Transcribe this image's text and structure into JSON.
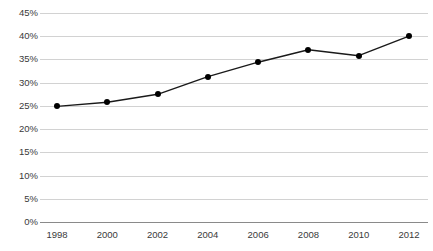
{
  "chart_data": {
    "type": "line",
    "title": "",
    "subtitle": "",
    "xlabel": "",
    "ylabel": "",
    "categories": [
      "1998",
      "2000",
      "2002",
      "2004",
      "2006",
      "2008",
      "2010",
      "2012"
    ],
    "x": [
      1998,
      2000,
      2002,
      2004,
      2006,
      2008,
      2010,
      2012
    ],
    "values": [
      24.9,
      25.8,
      27.5,
      31.3,
      34.4,
      37.1,
      35.8,
      40.0
    ],
    "series": [
      {
        "name": "",
        "values": [
          24.9,
          25.8,
          27.5,
          31.3,
          34.4,
          37.1,
          35.8,
          40.0
        ]
      }
    ],
    "ylim": [
      0,
      45
    ],
    "yticks": [
      0,
      5,
      10,
      15,
      20,
      25,
      30,
      35,
      40,
      45
    ],
    "ytick_labels": [
      "0%",
      "5%",
      "10%",
      "15%",
      "20%",
      "25%",
      "30%",
      "35%",
      "40%",
      "45%"
    ],
    "xtick_labels": [
      "1998",
      "2000",
      "2002",
      "2004",
      "2006",
      "2008",
      "2010",
      "2012"
    ],
    "grid": true,
    "legend": false,
    "legend_position": "none",
    "line_color": "#1a1a1a",
    "marker_color": "#000000",
    "gridline_color": "#d2d2d2",
    "axis_color": "#8a8a8a",
    "background_color": "#ffffff"
  },
  "axes": {
    "y_tick_labels": [
      "45%",
      "40%",
      "35%",
      "30%",
      "25%",
      "20%",
      "15%",
      "10%",
      "5%",
      "0%"
    ],
    "x_tick_labels": [
      "1998",
      "2000",
      "2002",
      "2004",
      "2006",
      "2008",
      "2010",
      "2012"
    ]
  }
}
